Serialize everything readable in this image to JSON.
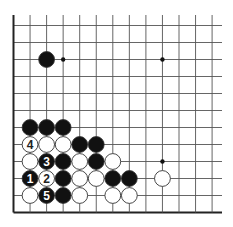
{
  "diagram": {
    "type": "go-board-fragment",
    "visible_columns": 13,
    "visible_rows": 12,
    "edges": [
      "left",
      "bottom"
    ],
    "colors": {
      "line": "#555555",
      "edge": "#222222",
      "black_stone": "#111111",
      "white_stone": "#ffffff",
      "stone_outline": "#333333"
    },
    "star_points": [
      {
        "col": 3,
        "row": 2
      },
      {
        "col": 9,
        "row": 2
      },
      {
        "col": 9,
        "row": 8
      }
    ],
    "stones": [
      {
        "color": "black",
        "col": 2,
        "row": 2,
        "label": ""
      },
      {
        "color": "black",
        "col": 1,
        "row": 6,
        "label": ""
      },
      {
        "color": "black",
        "col": 2,
        "row": 6,
        "label": ""
      },
      {
        "color": "black",
        "col": 3,
        "row": 6,
        "label": ""
      },
      {
        "color": "white",
        "col": 1,
        "row": 7,
        "label": "4"
      },
      {
        "color": "white",
        "col": 2,
        "row": 7,
        "label": ""
      },
      {
        "color": "white",
        "col": 3,
        "row": 7,
        "label": ""
      },
      {
        "color": "black",
        "col": 4,
        "row": 7,
        "label": ""
      },
      {
        "color": "black",
        "col": 5,
        "row": 7,
        "label": ""
      },
      {
        "color": "white",
        "col": 1,
        "row": 8,
        "label": ""
      },
      {
        "color": "black",
        "col": 2,
        "row": 8,
        "label": "3"
      },
      {
        "color": "black",
        "col": 3,
        "row": 8,
        "label": ""
      },
      {
        "color": "white",
        "col": 4,
        "row": 8,
        "label": ""
      },
      {
        "color": "black",
        "col": 5,
        "row": 8,
        "label": ""
      },
      {
        "color": "white",
        "col": 6,
        "row": 8,
        "label": ""
      },
      {
        "color": "black",
        "col": 1,
        "row": 9,
        "label": "1"
      },
      {
        "color": "white",
        "col": 2,
        "row": 9,
        "label": "2"
      },
      {
        "color": "black",
        "col": 3,
        "row": 9,
        "label": ""
      },
      {
        "color": "white",
        "col": 4,
        "row": 9,
        "label": ""
      },
      {
        "color": "white",
        "col": 5,
        "row": 9,
        "label": ""
      },
      {
        "color": "black",
        "col": 6,
        "row": 9,
        "label": ""
      },
      {
        "color": "black",
        "col": 7,
        "row": 9,
        "label": ""
      },
      {
        "color": "white",
        "col": 9,
        "row": 9,
        "label": ""
      },
      {
        "color": "white",
        "col": 1,
        "row": 10,
        "label": ""
      },
      {
        "color": "black",
        "col": 2,
        "row": 10,
        "label": "5"
      },
      {
        "color": "black",
        "col": 3,
        "row": 10,
        "label": ""
      },
      {
        "color": "white",
        "col": 4,
        "row": 10,
        "label": ""
      },
      {
        "color": "white",
        "col": 6,
        "row": 10,
        "label": ""
      },
      {
        "color": "white",
        "col": 7,
        "row": 10,
        "label": ""
      }
    ]
  }
}
